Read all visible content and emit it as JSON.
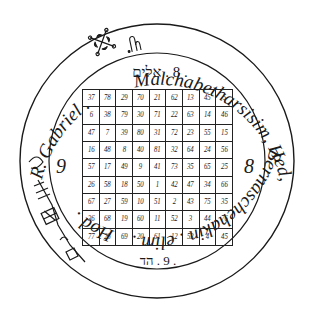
{
  "seal": {
    "ring_text_top": "R. Gabriel . ✕ . Malchabetharsisim, Hed, Bernaschehakin . elim .Hod .",
    "ring_segments": {
      "gabriel": "R. Gabriel .",
      "malchabetharsisim": "Malchabetharsisim, Hed,",
      "bernaschehakin": "Bernaschehakin . elim .",
      "hod": "Hod ."
    },
    "hebrew_top": ". 8 . אלים",
    "hebrew_bottom": ". 9 . הד",
    "side_left_number": "9",
    "side_right_number": "8",
    "icons": [
      "intelligence-sigil-icon",
      "lunar-seal-glyph-icon",
      "spirit-sigil-icon"
    ]
  },
  "magic_square": {
    "size": 9,
    "rows": [
      [
        "37",
        "78",
        "29",
        "70",
        "21",
        "62",
        "13",
        "45",
        "5"
      ],
      [
        "6",
        "38",
        "79",
        "30",
        "71",
        "22",
        "63",
        "14",
        "46"
      ],
      [
        "47",
        "7",
        "39",
        "80",
        "31",
        "72",
        "23",
        "55",
        "15"
      ],
      [
        "16",
        "48",
        "8",
        "40",
        "81",
        "32",
        "64",
        "24",
        "56"
      ],
      [
        "57",
        "17",
        "49",
        "9",
        "41",
        "73",
        "35",
        "65",
        "25"
      ],
      [
        "26",
        "58",
        "18",
        "50",
        "1",
        "42",
        "47",
        "34",
        "66"
      ],
      [
        "67",
        "27",
        "59",
        "10",
        "51",
        "2",
        "43",
        "75",
        "35"
      ],
      [
        "36",
        "68",
        "19",
        "60",
        "11",
        "52",
        "3",
        "44",
        "76"
      ],
      [
        "77",
        "28",
        "69",
        "20",
        "61",
        "12",
        "53",
        "4",
        "45"
      ]
    ]
  },
  "colors": {
    "ink": "#1a1a1a",
    "background": "#ffffff"
  }
}
